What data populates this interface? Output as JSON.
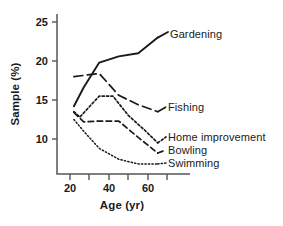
{
  "chart_data": {
    "type": "line",
    "title": "",
    "xlabel": "Age (yr)",
    "ylabel": "Sample (%)",
    "xlim": [
      18,
      72
    ],
    "ylim": [
      5.5,
      26
    ],
    "grid": false,
    "legend_position": "inline-right-of-line-ends",
    "xticks": [
      20,
      30,
      40,
      50,
      60,
      70
    ],
    "xticklabels": [
      "20",
      "",
      "40",
      "",
      "60",
      ""
    ],
    "yticks": [
      10,
      15,
      20,
      25
    ],
    "yticklabels": [
      "10",
      "15",
      "20",
      "25"
    ],
    "series": [
      {
        "name": "Gardening",
        "style": "solid",
        "x": [
          22,
          27,
          33,
          35,
          45,
          55,
          65
        ],
        "values": [
          14.2,
          16.6,
          19.0,
          19.8,
          20.6,
          21.0,
          23.0
        ]
      },
      {
        "name": "Fishing",
        "style": "long-dash",
        "x": [
          22,
          35,
          45,
          55,
          65
        ],
        "values": [
          18.0,
          18.4,
          15.6,
          14.4,
          13.5
        ]
      },
      {
        "name": "Home improvement",
        "style": "dotted-fine",
        "x": [
          22,
          25,
          35,
          42,
          50,
          58,
          65
        ],
        "values": [
          13.5,
          12.8,
          15.5,
          15.5,
          13.0,
          11.2,
          9.5
        ]
      },
      {
        "name": "Bowling",
        "style": "medium-dash",
        "x": [
          22,
          27,
          35,
          45,
          55,
          65
        ],
        "values": [
          13.4,
          12.2,
          12.3,
          12.3,
          10.2,
          8.2
        ]
      },
      {
        "name": "Swimming",
        "style": "dotted",
        "x": [
          22,
          27,
          35,
          45,
          55,
          65
        ],
        "values": [
          12.5,
          11.0,
          8.8,
          7.4,
          6.8,
          6.8
        ]
      }
    ]
  },
  "axes": {
    "ylabel": "Sample (%)",
    "xlabel": "Age (yr)",
    "ytick_labels": [
      "25",
      "20",
      "15",
      "10"
    ],
    "xtick_labels": [
      "20",
      "40",
      "60"
    ]
  },
  "labels": {
    "gardening": "Gardening",
    "fishing": "Fishing",
    "home_improvement": "Home improvement",
    "bowling": "Bowling",
    "swimming": "Swimming"
  },
  "colors": {
    "ink": "#1a1a1a",
    "axis": "#555555",
    "background": "#ffffff"
  }
}
